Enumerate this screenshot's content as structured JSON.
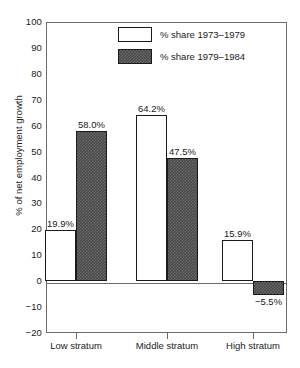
{
  "chart_data": {
    "type": "bar",
    "title": "",
    "xlabel": "",
    "ylabel": "% of net employment growth",
    "ylim": [
      -20,
      100
    ],
    "ytick_step": 10,
    "grid": false,
    "legend_position": "top-center-inside",
    "categories": [
      "Low stratum",
      "Middle stratum",
      "High stratum"
    ],
    "ytick_labels": [
      "100",
      "90",
      "80",
      "70",
      "60",
      "50",
      "40",
      "30",
      "20",
      "10",
      "0",
      "−10",
      "−20"
    ],
    "series": [
      {
        "name": "% share 1973–1979",
        "fill": "white",
        "color": "#ffffff",
        "values": [
          19.9,
          64.2,
          15.9
        ],
        "labels": [
          "19.9%",
          "64.2%",
          "15.9%"
        ]
      },
      {
        "name": "% share 1979–1984",
        "fill": "dark-textured",
        "color": "#4a4a4a",
        "values": [
          58.0,
          47.5,
          -5.5
        ],
        "labels": [
          "58.0%",
          "47.5%",
          "−5.5%"
        ]
      }
    ]
  },
  "legend": {
    "items": [
      {
        "label": "% share 1973–1979"
      },
      {
        "label": "% share 1979–1984"
      }
    ]
  },
  "axes": {
    "y_title": "% of net employment growth"
  }
}
